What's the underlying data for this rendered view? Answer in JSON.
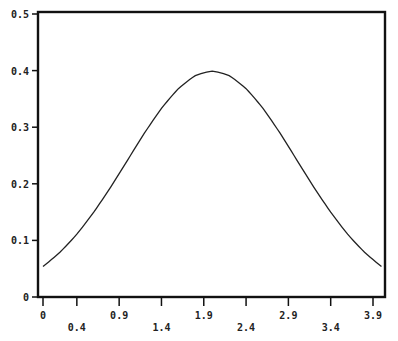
{
  "chart_data": {
    "type": "line",
    "title": "",
    "xlabel": "",
    "ylabel": "",
    "xlim": [
      0,
      4.0
    ],
    "ylim": [
      0,
      0.5
    ],
    "grid": false,
    "legend": null,
    "x_ticks": [
      "0",
      "0.4",
      "0.9",
      "1.4",
      "1.9",
      "2.4",
      "2.9",
      "3.4",
      "3.9"
    ],
    "x_tick_values": [
      0,
      0.4,
      0.9,
      1.4,
      1.9,
      2.4,
      2.9,
      3.4,
      3.9
    ],
    "y_ticks": [
      "0",
      "0.1",
      "0.2",
      "0.3",
      "0.4",
      "0.5"
    ],
    "y_tick_values": [
      0,
      0.1,
      0.2,
      0.3,
      0.4,
      0.5
    ],
    "series": [
      {
        "name": "normal density (mean 2, sd 1)",
        "x": [
          0,
          0.2,
          0.4,
          0.6,
          0.8,
          1.0,
          1.2,
          1.4,
          1.6,
          1.8,
          2.0,
          2.2,
          2.4,
          2.6,
          2.8,
          3.0,
          3.2,
          3.4,
          3.6,
          3.8,
          4.0
        ],
        "values": [
          0.054,
          0.079,
          0.111,
          0.15,
          0.194,
          0.242,
          0.29,
          0.333,
          0.368,
          0.391,
          0.399,
          0.391,
          0.368,
          0.333,
          0.29,
          0.242,
          0.194,
          0.15,
          0.111,
          0.079,
          0.054
        ]
      }
    ]
  }
}
